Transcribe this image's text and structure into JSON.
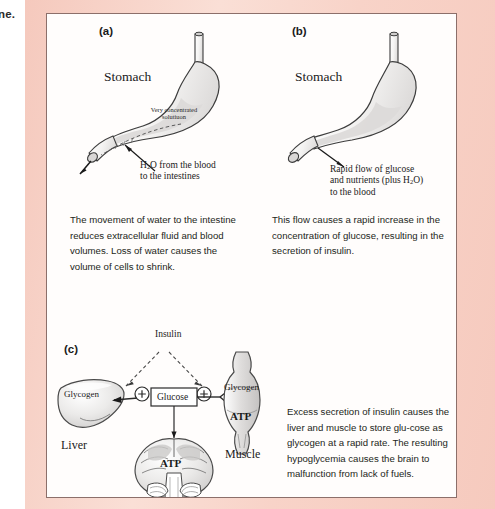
{
  "page": {
    "edge_text": "ne.",
    "frame_color": "#f7cfc4",
    "frame_border_color": "#8c6f6a",
    "background": "#ffffff"
  },
  "panels": [
    {
      "id": "a",
      "label": "(a)",
      "figure_name": "stomach-concentrated-solution",
      "organ_label": "Stomach",
      "inline_label_line1": "Very concentrated",
      "inline_label_line2": "solutiuon",
      "caption_line1": "H₂O from the blood",
      "caption_line2": "to the intestines",
      "caption_html": "H<sub>2</sub>O from the blood<br>to the intestines",
      "paragraph": "The movement of water to the intestine reduces extracellular fluid and blood volumes. Loss of water causes the volume of cells to shrink."
    },
    {
      "id": "b",
      "label": "(b)",
      "figure_name": "stomach-rapid-flow",
      "organ_label": "Stomach",
      "caption_line1": "Rapid flow of glucose",
      "caption_line2": "and nutrients (plus H₂O)",
      "caption_line3": "to the blood",
      "caption_html": "Rapid flow of glucose<br>and nutrients (plus H<sub>2</sub>O)<br>to the blood",
      "paragraph": "This flow causes a rapid increase in the concentration of glucose, resulting in the secretion of insulin."
    },
    {
      "id": "c",
      "label": "(c)",
      "figure_name": "insulin-glucose-distribution",
      "paragraph": "Excess secretion of insulin causes the liver and muscle to store glu-cose as glycogen at a rapid rate. The resulting hypoglycemia causes the brain to malfunction from lack of fuels."
    }
  ],
  "diagram_c": {
    "insulin_label": "Insulin",
    "glucose_box": "Glucose",
    "plus_symbol_left": "⊕",
    "plus_symbol_right": "⊕",
    "liver": {
      "organ_name": "Liver",
      "contents_label": "Glycogen"
    },
    "muscle": {
      "organ_name": "Muscle",
      "contents_label": "Glycogen",
      "energy_label": "ATP"
    },
    "brain": {
      "organ_name": "Brain",
      "energy_label": "ATP"
    }
  },
  "colors": {
    "ink": "#1a1a1a",
    "body_text": "#231f20",
    "organ_fill": "#e3e1e0",
    "organ_outline": "#4a4a4a",
    "frame_pink": "#f7cfc4"
  }
}
